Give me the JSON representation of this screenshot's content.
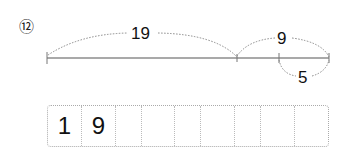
{
  "problem_number": "⑫",
  "diagram": {
    "top_arc_label": "19",
    "right_top_arc_label": "9",
    "bottom_arc_label": "5"
  },
  "answer_cells": [
    "1",
    "9",
    "",
    "",
    "",
    "",
    "",
    "",
    ""
  ]
}
